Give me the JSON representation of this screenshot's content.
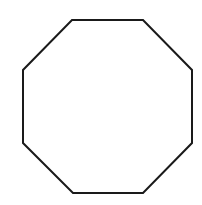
{
  "figure": {
    "shape": "octagon",
    "width": 202,
    "height": 205,
    "background": "#ffffff",
    "fill": "#ffffff",
    "stroke": "#1a1a1a",
    "stroke_width": 2,
    "points": "72,20 143,20 192,70 192,143 143,193 73,193 23,143 23,70"
  }
}
